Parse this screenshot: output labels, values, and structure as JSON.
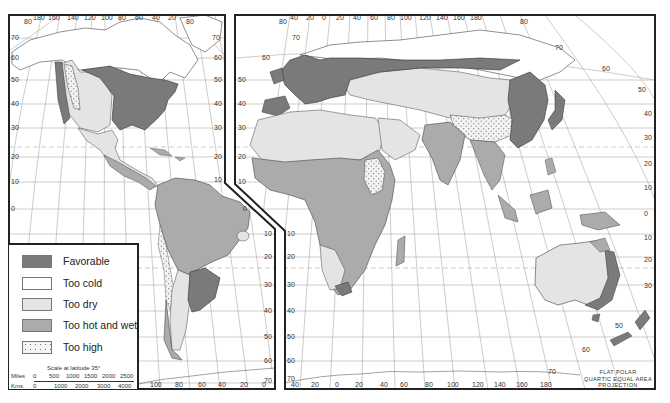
{
  "map": {
    "title": "World climatic suitability map",
    "projection_note": [
      "FLAT POLAR",
      "QUARTIC EQUAL AREA",
      "PROJECTION"
    ],
    "colors": {
      "favorable": "#7a7a7a",
      "too_cold": "#ffffff",
      "too_dry": "#e4e4e4",
      "too_hot_wet": "#ababab",
      "too_high": "#f1f1f1",
      "grid": "#9a9a9a",
      "border": "#222222"
    }
  },
  "legend": {
    "items": [
      {
        "label": "Favorable",
        "key": "favorable"
      },
      {
        "label": "Too cold",
        "key": "too_cold"
      },
      {
        "label": "Too dry",
        "key": "too_dry"
      },
      {
        "label": "Too hot and wet",
        "key": "too_hot_wet"
      },
      {
        "label": "Too high",
        "key": "too_high"
      }
    ],
    "scale": {
      "title": "Scale at latitude 35°",
      "miles_label": "Miles",
      "miles_ticks": [
        "0",
        "500",
        "1000",
        "1500",
        "2000",
        "2500"
      ],
      "kms_label": "Kms.",
      "kms_ticks": [
        "0",
        "1000",
        "2000",
        "3000",
        "4000"
      ]
    }
  },
  "left_panel": {
    "top_longitudes": [
      "180",
      "160",
      "140",
      "120",
      "100",
      "80",
      "60",
      "40",
      "20"
    ],
    "bottom_longitudes": [
      "100",
      "80",
      "60",
      "40",
      "20",
      "0"
    ],
    "left_latitudes": [
      "70",
      "60",
      "50",
      "40",
      "30",
      "20",
      "10",
      "0"
    ],
    "right_latitudes": [
      "70",
      "60",
      "50",
      "40",
      "30",
      "20",
      "10"
    ],
    "lower_right_latitudes": [
      "0",
      "10",
      "20",
      "30",
      "40",
      "50",
      "60",
      "70"
    ],
    "corner_labels": [
      "80",
      "80"
    ]
  },
  "right_panel": {
    "top_longitudes": [
      "40",
      "20",
      "0",
      "20",
      "40",
      "60",
      "80",
      "100",
      "120",
      "140",
      "160",
      "180"
    ],
    "bottom_longitudes": [
      "40",
      "20",
      "0",
      "20",
      "40",
      "60",
      "80",
      "100",
      "120",
      "140",
      "160",
      "180"
    ],
    "left_latitudes": [
      "70",
      "60",
      "50",
      "40",
      "30",
      "20",
      "10",
      "0",
      "10",
      "20",
      "30",
      "40",
      "50",
      "60",
      "70"
    ],
    "right_latitudes": [
      "80",
      "70",
      "60",
      "50",
      "40",
      "30",
      "20",
      "10",
      "0",
      "10",
      "20",
      "30"
    ],
    "southern_arc_labels": [
      "50",
      "60",
      "70"
    ]
  }
}
